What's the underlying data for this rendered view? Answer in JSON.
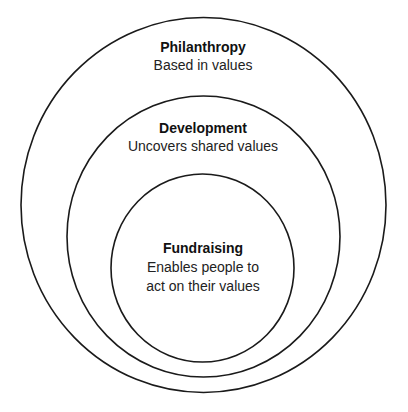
{
  "diagram": {
    "type": "nested-circles",
    "colors": {
      "stroke": "#1a1a1a",
      "background": "#ffffff",
      "text": "#111111"
    },
    "circles": [
      {
        "id": "philanthropy",
        "title": "Philanthropy",
        "lines": [
          "Based in values"
        ]
      },
      {
        "id": "development",
        "title": "Development",
        "lines": [
          "Uncovers shared values"
        ]
      },
      {
        "id": "fundraising",
        "title": "Fundraising",
        "lines": [
          "Enables people to",
          "act on their values"
        ]
      }
    ]
  }
}
